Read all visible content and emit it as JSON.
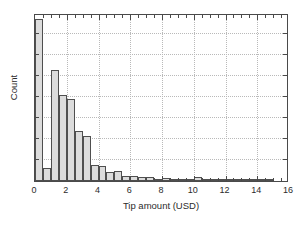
{
  "chart_data": {
    "type": "bar",
    "title": "",
    "xlabel": "Tip amount (USD)",
    "ylabel": "Count",
    "xlim": [
      0,
      16
    ],
    "ylim": [
      0,
      8000
    ],
    "grid": true,
    "legend": null,
    "bin_width": 0.5,
    "xticks": [
      0,
      2,
      4,
      6,
      8,
      10,
      12,
      14,
      16
    ],
    "xticklabels": [
      "0",
      "2",
      "4",
      "6",
      "8",
      "10",
      "12",
      "14",
      "16"
    ],
    "xminor_tick_step": 0.5,
    "yticks": [
      0,
      1000,
      2000,
      3000,
      4000,
      5000,
      6000,
      7000,
      8000
    ],
    "yticklabels": [
      "",
      "",
      "",
      "",
      "",
      "",
      "",
      "",
      ""
    ],
    "bar_fill_color": "#dcdcdc",
    "bar_edge_color": "#4f4f4f",
    "grid_color": "#b9b9b9",
    "axis_color": "#4a4a4a",
    "bins": [
      {
        "x0": 0.0,
        "x1": 0.5,
        "value": 7700
      },
      {
        "x0": 0.5,
        "x1": 1.0,
        "value": 640
      },
      {
        "x0": 1.0,
        "x1": 1.5,
        "value": 5300
      },
      {
        "x0": 1.5,
        "x1": 2.0,
        "value": 4090
      },
      {
        "x0": 2.0,
        "x1": 2.5,
        "value": 3900
      },
      {
        "x0": 2.5,
        "x1": 3.0,
        "value": 2400
      },
      {
        "x0": 3.0,
        "x1": 3.5,
        "value": 2150
      },
      {
        "x0": 3.5,
        "x1": 4.0,
        "value": 740
      },
      {
        "x0": 4.0,
        "x1": 4.5,
        "value": 700
      },
      {
        "x0": 4.5,
        "x1": 5.0,
        "value": 420
      },
      {
        "x0": 5.0,
        "x1": 5.5,
        "value": 470
      },
      {
        "x0": 5.5,
        "x1": 6.0,
        "value": 230
      },
      {
        "x0": 6.0,
        "x1": 6.5,
        "value": 255
      },
      {
        "x0": 6.5,
        "x1": 7.0,
        "value": 170
      },
      {
        "x0": 7.0,
        "x1": 7.5,
        "value": 175
      },
      {
        "x0": 7.5,
        "x1": 8.0,
        "value": 115
      },
      {
        "x0": 8.0,
        "x1": 8.5,
        "value": 145
      },
      {
        "x0": 8.5,
        "x1": 9.0,
        "value": 95
      },
      {
        "x0": 9.0,
        "x1": 9.5,
        "value": 35
      },
      {
        "x0": 9.5,
        "x1": 10.0,
        "value": 30
      },
      {
        "x0": 10.0,
        "x1": 10.5,
        "value": 210
      },
      {
        "x0": 10.5,
        "x1": 11.0,
        "value": 40
      },
      {
        "x0": 11.0,
        "x1": 11.5,
        "value": 110
      },
      {
        "x0": 11.5,
        "x1": 12.0,
        "value": 45
      },
      {
        "x0": 12.0,
        "x1": 12.5,
        "value": 100
      },
      {
        "x0": 12.5,
        "x1": 13.0,
        "value": 40
      },
      {
        "x0": 13.0,
        "x1": 13.5,
        "value": 75
      },
      {
        "x0": 13.5,
        "x1": 14.0,
        "value": 35
      },
      {
        "x0": 14.0,
        "x1": 14.5,
        "value": 95
      },
      {
        "x0": 14.5,
        "x1": 15.0,
        "value": 20
      }
    ]
  }
}
